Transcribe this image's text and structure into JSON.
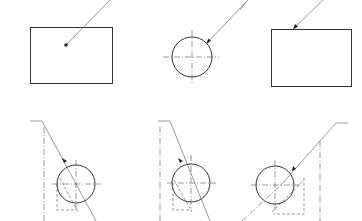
{
  "figure": {
    "colors": {
      "line": "#333333",
      "background": "#ffffff"
    },
    "panels": [
      {
        "id": "rect-dot",
        "description": "Rectangle with leader ending in a dot inside the area",
        "terminator": "dot"
      },
      {
        "id": "circle-arrow-top",
        "description": "Circle with centre lines and leader ending in an arrowhead on the outline",
        "terminator": "arrow"
      },
      {
        "id": "rect-arrow",
        "description": "Rectangle with leader ending in an arrowhead on the top edge",
        "terminator": "arrow"
      },
      {
        "id": "cyl-left",
        "description": "Circle with centre lines, leader and hidden-line section, leader sloping down-right",
        "terminator": "arrow"
      },
      {
        "id": "cyl-middle",
        "description": "Circle with centre lines, leader and hidden-line section, leader sloping down-right",
        "terminator": "arrow"
      },
      {
        "id": "cyl-right",
        "description": "Circle with centre lines, leader and hidden-line section, leader sloping down-left",
        "terminator": "arrow"
      }
    ]
  }
}
